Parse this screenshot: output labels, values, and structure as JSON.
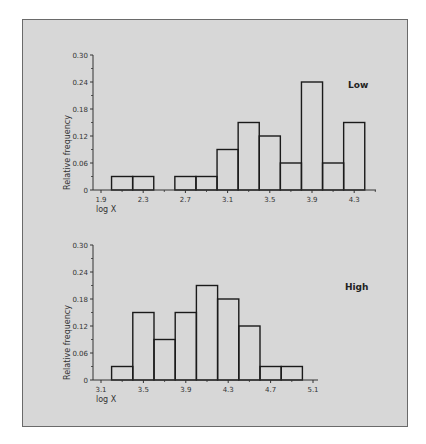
{
  "chart_data": [
    {
      "type": "bar",
      "panel_label": "Low",
      "xlabel": "log X",
      "ylabel": "Relative frequency",
      "xlim": [
        1.82,
        4.5
      ],
      "ylim": [
        0,
        0.3
      ],
      "x_ticks": [
        1.9,
        2.3,
        2.7,
        3.1,
        3.5,
        3.9,
        4.3
      ],
      "x_tick_labels": [
        "1.9",
        "2.3",
        "2.7",
        "3.1",
        "3.5",
        "3.9",
        "4.3"
      ],
      "x_minor_ticks": [
        2.1,
        2.5,
        2.9,
        3.3,
        3.7,
        4.1,
        4.5
      ],
      "y_ticks": [
        0,
        0.06,
        0.12,
        0.18,
        0.24,
        0.3
      ],
      "y_tick_labels": [
        "0",
        "0.06",
        "0.12",
        "0.18",
        "0.24",
        "0.30"
      ],
      "bin_width": 0.2,
      "bins": [
        {
          "start": 2.0,
          "value": 0.03
        },
        {
          "start": 2.2,
          "value": 0.03
        },
        {
          "start": 2.6,
          "value": 0.03
        },
        {
          "start": 2.8,
          "value": 0.03
        },
        {
          "start": 3.0,
          "value": 0.09
        },
        {
          "start": 3.2,
          "value": 0.15
        },
        {
          "start": 3.4,
          "value": 0.12
        },
        {
          "start": 3.6,
          "value": 0.06
        },
        {
          "start": 3.8,
          "value": 0.24
        },
        {
          "start": 4.0,
          "value": 0.06
        },
        {
          "start": 4.2,
          "value": 0.15
        }
      ]
    },
    {
      "type": "bar",
      "panel_label": "High",
      "xlabel": "log X",
      "ylabel": "Relative frequency",
      "xlim": [
        3.02,
        5.2
      ],
      "ylim": [
        0,
        0.3
      ],
      "x_ticks": [
        3.1,
        3.5,
        3.9,
        4.3,
        4.7,
        5.1
      ],
      "x_tick_labels": [
        "3.1",
        "3.5",
        "3.9",
        "4.3",
        "4.7",
        "5.1"
      ],
      "x_minor_ticks": [
        3.3,
        3.7,
        4.1,
        4.5,
        4.9
      ],
      "y_ticks": [
        0,
        0.06,
        0.12,
        0.18,
        0.24,
        0.3
      ],
      "y_tick_labels": [
        "0",
        "0.06",
        "0.12",
        "0.18",
        "0.24",
        "0.30"
      ],
      "bin_width": 0.2,
      "bins": [
        {
          "start": 3.2,
          "value": 0.03
        },
        {
          "start": 3.4,
          "value": 0.15
        },
        {
          "start": 3.6,
          "value": 0.09
        },
        {
          "start": 3.8,
          "value": 0.15
        },
        {
          "start": 4.0,
          "value": 0.21
        },
        {
          "start": 4.2,
          "value": 0.18
        },
        {
          "start": 4.4,
          "value": 0.12
        },
        {
          "start": 4.6,
          "value": 0.03
        },
        {
          "start": 4.8,
          "value": 0.03
        }
      ]
    }
  ]
}
